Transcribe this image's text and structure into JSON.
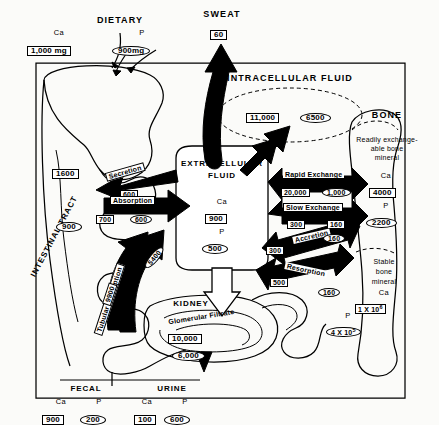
{
  "diagram": {
    "legend": {
      "ca_shape": "rectangle",
      "p_shape": "ellipse"
    },
    "colors": {
      "ink": "#000000",
      "paper": "#fbfbf9",
      "arrow": "#000000"
    }
  },
  "inputs": {
    "dietary": {
      "label": "DIETARY",
      "ca_label": "Ca",
      "p_label": "P",
      "ca_value": "1,000 mg",
      "p_value": "900mg"
    },
    "sweat": {
      "label": "SWEAT",
      "ca_value": "60"
    }
  },
  "compartments": {
    "intestinal_tract": {
      "label": "INTESTINAL TRACT",
      "ca_value": "1600",
      "p_value": "900"
    },
    "intracellular_fluid": {
      "label": "INTRACELLULAR FLUID",
      "ca_value": "11,000",
      "p_value": "6500"
    },
    "extracellular_fluid": {
      "label_line1": "EXTRACELLULAR",
      "label_line2": "FLUID",
      "ca_label": "Ca",
      "p_label": "P",
      "ca_value": "900",
      "p_value": "500"
    },
    "kidney": {
      "label": "KIDNEY",
      "filtrate_label": "Glomerular Filtrate",
      "ca_value": "10,000",
      "p_value": "6,000"
    },
    "bone": {
      "label": "BONE",
      "readily_exchangeable": {
        "line1": "Readily exchange-",
        "line2": "able bone",
        "line3": "mineral",
        "ca_label": "Ca",
        "ca_value": "4000",
        "p_label": "P",
        "p_value": "2200"
      },
      "stable": {
        "line1": "Stable",
        "line2": "bone",
        "line3": "mineral",
        "ca_label": "Ca",
        "ca_value": "1 X 10",
        "ca_exp": "6",
        "p_label": "P",
        "p_value": "4 X 10",
        "p_exp": "5"
      }
    }
  },
  "fluxes": {
    "secretion": {
      "label": "Secretion",
      "ca_value": "600"
    },
    "absorption": {
      "label": "Absorption",
      "ca_value": "700",
      "p_value": "600"
    },
    "tubular_resorption": {
      "label": "Tubular Resorption",
      "ca_value": "9900",
      "p_value": "5400"
    },
    "rapid_exchange": {
      "label": "Rapid Exchange",
      "ca_value": "20,000",
      "p_value": "1,000"
    },
    "slow_exchange": {
      "label": "Slow Exchange",
      "ca_value": "300",
      "p_value": "160"
    },
    "accretion": {
      "label": "Accretion",
      "ca_value": "300",
      "p_value": "160"
    },
    "resorption": {
      "label": "Resorption",
      "ca_value": "500",
      "p_value": "160"
    }
  },
  "outputs": {
    "fecal": {
      "label": "FECAL",
      "ca_label": "Ca",
      "p_label": "P",
      "ca_value": "900",
      "p_value": "200"
    },
    "urine": {
      "label": "URINE",
      "ca_label": "Ca",
      "p_label": "P",
      "ca_value": "100",
      "p_value": "600"
    }
  }
}
